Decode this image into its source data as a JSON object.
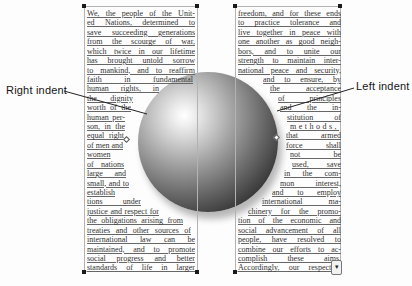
{
  "labels": {
    "right_indent": "Right indent",
    "left_indent": "Left indent"
  },
  "columns": {
    "left": {
      "lines": [
        "We, the people of the Unit-",
        "ed Nations, determined to",
        "save succeeding generations",
        "from the scourge of war,",
        "which twice in our lifetime",
        "has brought untold sorrow",
        "to mankind, and to reaffirm",
        "faith in fundamental",
        "human rights, in",
        "the dignity and",
        "worth of the",
        "human per-",
        "son, in the",
        "equal right",
        "of men and",
        "women and",
        "of nations",
        "large and",
        "small, and to",
        "establish condi-",
        "tions under which",
        "justice and respect for",
        "the obligations arising from",
        "treaties and other sources of",
        "international law can be",
        "maintained, and to promote",
        "social progress and better",
        "standards of life in larger"
      ],
      "right_indents": [
        0,
        0,
        0,
        0,
        0,
        0,
        0,
        2,
        36,
        62,
        64,
        70,
        70,
        71,
        72,
        71,
        71,
        69,
        66,
        62,
        54,
        36,
        12,
        4,
        0,
        0,
        0,
        0
      ],
      "spread_indices": []
    },
    "right": {
      "lines": [
        "freedom, and for these ends",
        "to practice tolerance and",
        "live together in peace with",
        "one another as good neigh-",
        "bors, and to unite our",
        "strength to maintain inter-",
        "national peace and security,",
        "and to ensure, by",
        "the acceptance",
        "of principles",
        "and the in-",
        "stitution of",
        "methods,",
        "that armed",
        "force shall",
        "not be",
        "used, save",
        "in the com-",
        "mon interest,",
        "and to employ",
        "international ma-",
        "chinery for the promo-",
        "tion of the economic and",
        "social advancement of all",
        "people, have resolved to",
        "combine our efforts to ac-",
        "complish these aims.",
        "Accordingly, our respective"
      ],
      "left_indents": [
        0,
        0,
        0,
        0,
        0,
        0,
        0,
        25,
        32,
        40,
        42,
        49,
        52,
        48,
        48,
        52,
        54,
        46,
        42,
        34,
        24,
        10,
        0,
        0,
        0,
        0,
        0,
        0
      ],
      "spread_indices": [
        12
      ]
    }
  },
  "sphere": {
    "highlight_color": "#ffffff",
    "mid_color": "#999999",
    "dark_color": "#161616",
    "shadow_color": "rgba(0,0,0,0.28)"
  },
  "icons": {
    "more_text_glyph": "▾"
  },
  "layout_hints": {
    "left_column_text_width": 108,
    "right_column_text_width": 103
  }
}
